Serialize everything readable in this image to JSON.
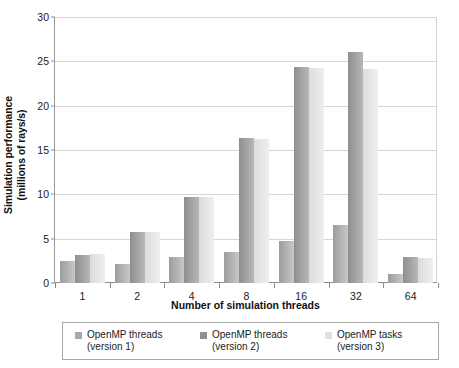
{
  "chart_data": {
    "type": "bar",
    "title": "",
    "xlabel": "Number of simulation threads",
    "ylabel_line1": "Simulation performance",
    "ylabel_line2": "(millions of rays/s)",
    "categories": [
      "1",
      "2",
      "4",
      "8",
      "16",
      "32",
      "64"
    ],
    "ylim": [
      0,
      30
    ],
    "yticks": [
      0,
      5,
      10,
      15,
      20,
      25,
      30
    ],
    "grid": true,
    "legend_position": "bottom",
    "series": [
      {
        "name": "OpenMP threads (version 1)",
        "name_line1": "OpenMP threads",
        "name_line2": "(version 1)",
        "color": "#a9a9a9",
        "values": [
          2.5,
          2.1,
          2.9,
          3.5,
          4.7,
          6.5,
          1.0
        ]
      },
      {
        "name": "OpenMP threads (version 2)",
        "name_line1": "OpenMP threads",
        "name_line2": "(version 2)",
        "color": "#8f8f8f",
        "values": [
          3.2,
          5.8,
          9.7,
          16.3,
          24.4,
          26.0,
          2.9
        ]
      },
      {
        "name": "OpenMP tasks (version 3)",
        "name_line1": "OpenMP tasks",
        "name_line2": "(version 3)",
        "color": "#e0e0e0",
        "values": [
          3.3,
          5.7,
          9.7,
          16.2,
          24.2,
          24.1,
          2.8
        ]
      }
    ]
  }
}
